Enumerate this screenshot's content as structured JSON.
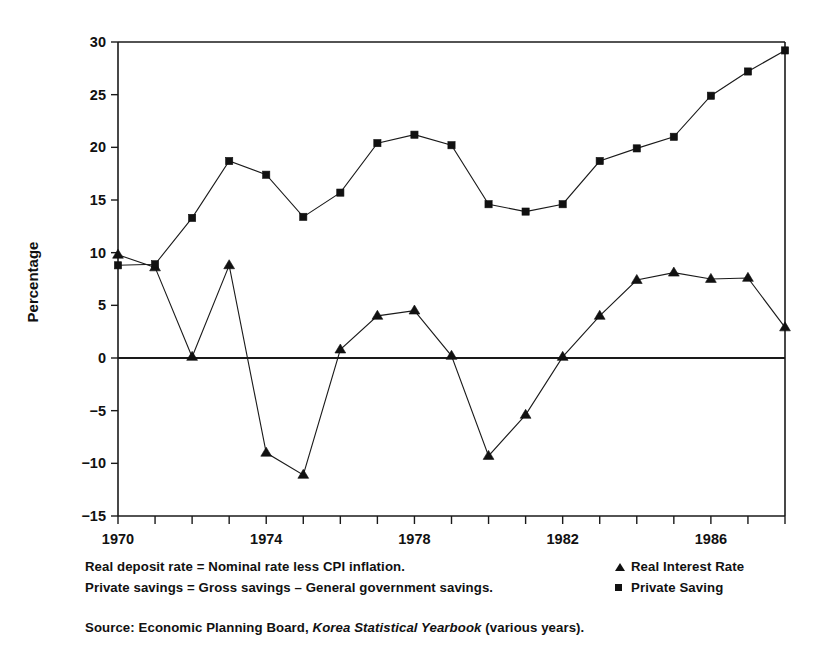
{
  "chart_data": {
    "type": "line",
    "title": "",
    "xlabel": "",
    "ylabel": "Percentage",
    "xlim": [
      1970,
      1988
    ],
    "ylim": [
      -15,
      30
    ],
    "grid": false,
    "legend_position": "below-right",
    "x": [
      1970,
      1971,
      1972,
      1973,
      1974,
      1975,
      1976,
      1977,
      1978,
      1979,
      1980,
      1981,
      1982,
      1983,
      1984,
      1985,
      1986,
      1987,
      1988
    ],
    "xticks": [
      1970,
      1971,
      1972,
      1973,
      1974,
      1975,
      1976,
      1977,
      1978,
      1979,
      1980,
      1981,
      1982,
      1983,
      1984,
      1985,
      1986,
      1987,
      1988
    ],
    "xtick_labels_shown": [
      "1970",
      "1974",
      "1978",
      "1982",
      "1986"
    ],
    "xtick_labels_shown_values": [
      1970,
      1974,
      1978,
      1982,
      1986
    ],
    "yticks": [
      -15,
      -10,
      -5,
      0,
      5,
      10,
      15,
      20,
      25,
      30
    ],
    "ytick_labels": [
      "−15",
      "−10",
      "−5",
      "0",
      "5",
      "10",
      "15",
      "20",
      "25",
      "30"
    ],
    "series": [
      {
        "name": "Real Interest Rate",
        "marker": "triangle",
        "values": [
          9.8,
          8.6,
          0.1,
          8.8,
          -9.0,
          -11.1,
          0.8,
          4.0,
          4.5,
          0.2,
          -9.3,
          -5.4,
          0.1,
          4.0,
          7.4,
          8.1,
          7.5,
          7.6,
          2.9
        ]
      },
      {
        "name": "Private Saving",
        "marker": "square",
        "values": [
          8.8,
          8.9,
          13.3,
          18.7,
          17.4,
          13.4,
          15.7,
          20.4,
          21.2,
          20.2,
          14.6,
          13.9,
          14.6,
          18.7,
          19.9,
          21.0,
          24.9,
          27.2,
          29.2
        ]
      }
    ]
  },
  "notes": [
    "Real deposit rate = Nominal rate less CPI inflation.",
    "Private savings = Gross savings – General government savings."
  ],
  "source": {
    "prefix": "Source: Economic Planning Board,",
    "italic": "Korea Statistical Yearbook",
    "suffix": "(various years)."
  },
  "legend": {
    "items": [
      {
        "label": "Real Interest Rate",
        "marker": "triangle"
      },
      {
        "label": "Private Saving",
        "marker": "square"
      }
    ]
  },
  "colors": {
    "ink": "#111111",
    "background": "#ffffff"
  }
}
